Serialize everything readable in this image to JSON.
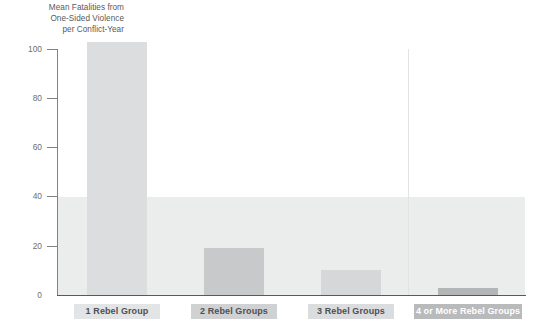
{
  "chart_data": {
    "type": "bar",
    "title": "",
    "subtitle": "",
    "ylabel": "Mean Fatalities from\nOne-Sided Violence\nper Conflict-Year",
    "xlabel": "",
    "categories": [
      "1 Rebel Group",
      "2 Rebel Groups",
      "3 Rebel Groups",
      "4 or More Rebel Groups"
    ],
    "values": [
      103,
      19,
      10,
      3
    ],
    "ylim": [
      0,
      100
    ],
    "ytick_labels": [
      "0",
      "20",
      "40",
      "60",
      "80",
      "100"
    ],
    "ytick_values": [
      0,
      20,
      40,
      60,
      80,
      100
    ],
    "grid": false,
    "legend": "none",
    "annotations": {
      "shaded_band_range": [
        0,
        40
      ],
      "shaded_band_color": "#ebecec",
      "divider_before_category": "4 or More Rebel Groups"
    },
    "bar_colors": [
      "#dcdddf",
      "#c7c9cb",
      "#d5d7d8",
      "#b3b5b7"
    ],
    "category_chip_colors": [
      {
        "background": "#e3e4e5",
        "text": "#4f5052"
      },
      {
        "background": "#cfd1d2",
        "text": "#4f5052"
      },
      {
        "background": "#dbdcdd",
        "text": "#4f5052"
      },
      {
        "background": "#b9babc",
        "text": "#ffffff"
      }
    ]
  },
  "axis": {
    "y_title": "Mean Fatalities from\nOne-Sided Violence\nper Conflict-Year",
    "ticks": [
      {
        "label": "100",
        "value": 100
      },
      {
        "label": "80",
        "value": 80
      },
      {
        "label": "60",
        "value": 60
      },
      {
        "label": "40",
        "value": 40
      },
      {
        "label": "20",
        "value": 20
      },
      {
        "label": "0",
        "value": 0
      }
    ]
  },
  "labels": {
    "tick_100": "100",
    "tick_80": "80",
    "tick_60": "60",
    "tick_40": "40",
    "tick_20": "20",
    "tick_0": "0",
    "cat_0": "1 Rebel Group",
    "cat_1": "2 Rebel Groups",
    "cat_2": "3 Rebel Groups",
    "cat_3": "4 or More Rebel Groups"
  }
}
